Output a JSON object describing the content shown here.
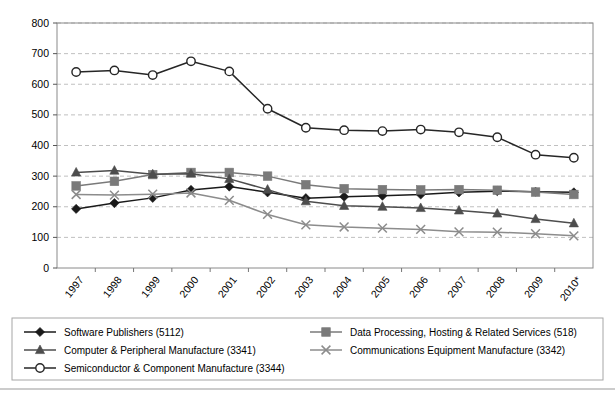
{
  "chart_data": {
    "type": "line",
    "title": "",
    "subtitle": "",
    "xlabel": "",
    "ylabel": "",
    "ylim": [
      0,
      800
    ],
    "ytick_step": 100,
    "yticks": [
      "0",
      "100",
      "200",
      "300",
      "400",
      "500",
      "600",
      "700",
      "800"
    ],
    "grid": true,
    "grid_style": "dashed horizontal",
    "legend_position": "below-plot",
    "categories": [
      "1997",
      "1998",
      "1999",
      "2000",
      "2001",
      "2002",
      "2003",
      "2004",
      "2005",
      "2006",
      "2007",
      "2008",
      "2009",
      "2010*"
    ],
    "series": [
      {
        "name": "Software Publishers (5112)",
        "short": "software-publishers",
        "code": "5112",
        "marker": "diamond",
        "color": "#1a1a1a",
        "values": [
          193,
          212,
          229,
          255,
          266,
          247,
          228,
          233,
          236,
          240,
          247,
          251,
          249,
          247
        ]
      },
      {
        "name": "Data Processing, Hosting & Related Services (518)",
        "short": "data-processing",
        "code": "518",
        "marker": "square",
        "color": "#7a7a7a",
        "values": [
          268,
          283,
          305,
          312,
          312,
          300,
          272,
          259,
          256,
          255,
          256,
          254,
          248,
          240
        ]
      },
      {
        "name": "Computer & Peripheral Manufacture (3341)",
        "short": "computer-peripheral",
        "code": "3341",
        "marker": "triangle",
        "color": "#4d4d4d",
        "values": [
          312,
          318,
          306,
          308,
          291,
          256,
          218,
          203,
          200,
          196,
          188,
          178,
          160,
          146
        ]
      },
      {
        "name": "Communications Equipment Manufacture (3342)",
        "short": "communications-equipment",
        "code": "3342",
        "marker": "cross",
        "color": "#8c8c8c",
        "values": [
          240,
          238,
          241,
          245,
          221,
          175,
          141,
          134,
          130,
          126,
          118,
          117,
          112,
          105
        ]
      },
      {
        "name": "Semiconductor & Component Manufacture (3344)",
        "short": "semiconductor-component",
        "code": "3344",
        "marker": "circle-open",
        "color": "#262626",
        "values": [
          640,
          645,
          630,
          675,
          642,
          520,
          458,
          450,
          447,
          452,
          443,
          427,
          370,
          360
        ]
      }
    ]
  },
  "legend": {
    "entries": [
      {
        "label": "Software Publishers (5112)",
        "marker": "diamond",
        "color": "#1a1a1a"
      },
      {
        "label": "Data Processing, Hosting & Related Services (518)",
        "marker": "square",
        "color": "#7a7a7a"
      },
      {
        "label": "Computer & Peripheral Manufacture (3341)",
        "marker": "triangle",
        "color": "#4d4d4d"
      },
      {
        "label": "Communications Equipment Manufacture (3342)",
        "marker": "cross",
        "color": "#8c8c8c"
      },
      {
        "label": "Semiconductor & Component Manufacture (3344)",
        "marker": "circle-open",
        "color": "#262626"
      }
    ]
  },
  "colors": {
    "plot_border": "#8a8a8a",
    "grid": "#b9b9b9",
    "axis_text": "#000000",
    "legend_border": "#a6a6a6",
    "background": "#ffffff"
  }
}
